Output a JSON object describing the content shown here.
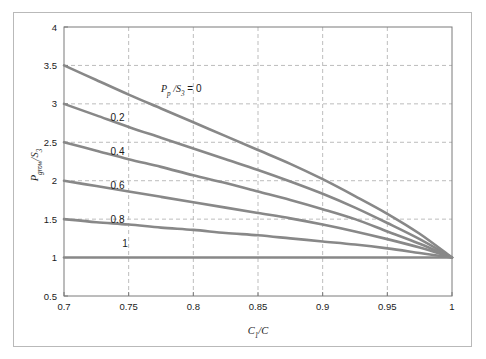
{
  "figure": {
    "background_color": "#ffffff",
    "frame_color": "#b9b9b9",
    "curve_color": "#888888",
    "grid_color": "#b5b5b5",
    "axis_color": "#7a7a7a"
  },
  "chart_data": {
    "type": "line",
    "title": "",
    "subtitle": "",
    "xlabel": "C1/C",
    "xlabel_parts": {
      "base": "C",
      "sub": "1",
      "tail": "/C"
    },
    "ylabel": "Pgrow/S3",
    "ylabel_parts": {
      "base": "P",
      "sub": "grow",
      "tail": "/S",
      "tail_sub": "3"
    },
    "xlim": [
      0.7,
      1.0
    ],
    "ylim": [
      0.5,
      4.0
    ],
    "xticks": [
      0.7,
      0.75,
      0.8,
      0.85,
      0.9,
      0.95,
      1
    ],
    "xtick_labels": [
      "0.7",
      "0.75",
      "0.8",
      "0.85",
      "0.9",
      "0.95",
      "1"
    ],
    "yticks": [
      0.5,
      1,
      1.5,
      2,
      2.5,
      3,
      3.5,
      4
    ],
    "ytick_labels": [
      "0.5",
      "1",
      "1.5",
      "2",
      "2.5",
      "3",
      "3.5",
      "4"
    ],
    "grid": true,
    "grid_style": "dashed",
    "legend_position": "inline-curve-labels",
    "legend_title": "Pp/S3 =",
    "legend_title_parts": {
      "base": "P",
      "sub": "p",
      "tail": "/S",
      "tail_sub": "3",
      "eq": "="
    },
    "x": [
      0.7,
      0.725,
      0.75,
      0.775,
      0.8,
      0.825,
      0.85,
      0.875,
      0.9,
      0.925,
      0.95,
      0.975,
      1.0
    ],
    "series": [
      {
        "name": "0",
        "label": "0",
        "label_x": 0.775,
        "label_y": 3.16,
        "values": [
          3.5,
          3.31,
          3.12,
          2.94,
          2.76,
          2.58,
          2.4,
          2.22,
          2.02,
          1.8,
          1.57,
          1.31,
          1.0
        ]
      },
      {
        "name": "0.2",
        "label": "0.2",
        "label_x": 0.736,
        "label_y": 2.78,
        "values": [
          3.0,
          2.85,
          2.7,
          2.56,
          2.42,
          2.28,
          2.14,
          1.99,
          1.83,
          1.65,
          1.45,
          1.24,
          1.0
        ]
      },
      {
        "name": "0.4",
        "label": "0.4",
        "label_x": 0.736,
        "label_y": 2.33,
        "values": [
          2.5,
          2.39,
          2.28,
          2.18,
          2.07,
          1.97,
          1.86,
          1.75,
          1.63,
          1.5,
          1.34,
          1.18,
          1.0
        ]
      },
      {
        "name": "0.6",
        "label": "0.6",
        "label_x": 0.736,
        "label_y": 1.89,
        "values": [
          2.0,
          1.93,
          1.86,
          1.79,
          1.72,
          1.65,
          1.58,
          1.51,
          1.43,
          1.34,
          1.24,
          1.13,
          1.0
        ]
      },
      {
        "name": "0.8",
        "label": "0.8",
        "label_x": 0.736,
        "label_y": 1.45,
        "values": [
          1.5,
          1.46,
          1.43,
          1.39,
          1.36,
          1.32,
          1.29,
          1.25,
          1.21,
          1.17,
          1.12,
          1.06,
          1.0
        ]
      },
      {
        "name": "1",
        "label": "1",
        "label_x": 0.745,
        "label_y": 1.14,
        "values": [
          1.0,
          1.0,
          1.0,
          1.0,
          1.0,
          1.0,
          1.0,
          1.0,
          1.0,
          1.0,
          1.0,
          1.0,
          1.0
        ]
      }
    ]
  }
}
